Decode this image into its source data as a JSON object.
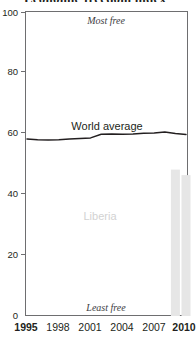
{
  "title": {
    "text": "Economic freedom index",
    "note": "cropped at top edge of screenshot"
  },
  "annotations": {
    "most_free": "Most free",
    "least_free": "Least free",
    "world_average": "World average",
    "country": "Liberia"
  },
  "colors": {
    "frame": "#6e6e70",
    "line": "#231f20",
    "bar": "#e6e6e6",
    "bar_edge": "#dcdcdc",
    "country_label": "#d2d2d2",
    "text": "#231f20",
    "note_text": "#3d3d3f"
  },
  "chart_data": {
    "type": "line",
    "title": "Economic freedom index",
    "xlabel": "",
    "ylabel": "",
    "ylim": [
      0,
      100
    ],
    "xlim": [
      1995,
      2010
    ],
    "grid": false,
    "legend": "inline labels",
    "y_ticks": [
      0,
      20,
      40,
      60,
      80,
      100
    ],
    "x_ticks": [
      1995,
      1998,
      2001,
      2004,
      2007,
      2010
    ],
    "x_ticks_emphasis": [
      1995,
      2010
    ],
    "series": [
      {
        "name": "World average",
        "render": "line",
        "color": "#231f20",
        "x": [
          1995,
          1996,
          1997,
          1998,
          1999,
          2000,
          2001,
          2002,
          2003,
          2004,
          2005,
          2006,
          2007,
          2008,
          2009,
          2010
        ],
        "values": [
          58.0,
          57.8,
          57.7,
          57.8,
          58.0,
          58.2,
          58.4,
          59.6,
          59.7,
          59.6,
          59.7,
          59.9,
          60.0,
          60.3,
          59.8,
          59.5
        ]
      },
      {
        "name": "Liberia",
        "render": "bar",
        "color": "#e6e6e6",
        "x": [
          2009,
          2010
        ],
        "values": [
          48.0,
          46.2
        ]
      }
    ]
  }
}
